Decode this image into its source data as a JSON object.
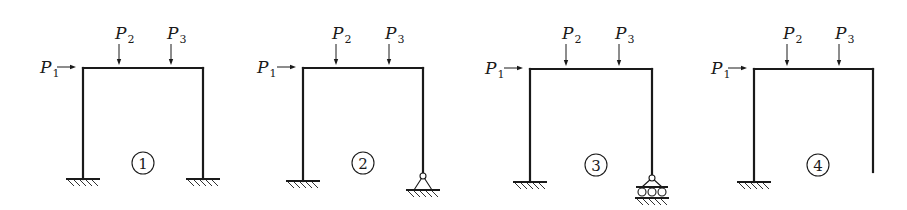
{
  "diagram": {
    "type": "structural-frame-comparison",
    "colors": {
      "ink": "#1a1a1a",
      "background": "#ffffff"
    },
    "loads": [
      {
        "id": "P1",
        "symbol": "P",
        "subscript": "1",
        "direction": "right",
        "position": "left-top-corner"
      },
      {
        "id": "P2",
        "symbol": "P",
        "subscript": "2",
        "direction": "down",
        "position": "beam-left-third"
      },
      {
        "id": "P3",
        "symbol": "P",
        "subscript": "3",
        "direction": "down",
        "position": "beam-right-third"
      }
    ],
    "frames": [
      {
        "label": "①",
        "left_support": "fixed",
        "right_support": "fixed",
        "geometry": {
          "left_x": 83,
          "right_x": 203,
          "beam_y": 68,
          "p1_label_x": 40,
          "p2_x": 119,
          "p3_x": 171,
          "left_base_y": 179,
          "right_base_y": 179,
          "num_x": 143,
          "num_y": 163
        }
      },
      {
        "label": "②",
        "left_support": "fixed",
        "right_support": "pinned",
        "geometry": {
          "left_x": 303,
          "right_x": 423,
          "beam_y": 68,
          "p1_label_x": 257,
          "p2_x": 336,
          "p3_x": 389,
          "left_base_y": 181,
          "right_base_y": 176,
          "num_x": 363,
          "num_y": 163
        }
      },
      {
        "label": "③",
        "left_support": "fixed",
        "right_support": "roller",
        "geometry": {
          "left_x": 530,
          "right_x": 652,
          "beam_y": 69,
          "p1_label_x": 485,
          "p2_x": 566,
          "p3_x": 619,
          "left_base_y": 182,
          "right_base_y": 178,
          "num_x": 596,
          "num_y": 165
        }
      },
      {
        "label": "④",
        "left_support": "fixed",
        "right_support": "free",
        "geometry": {
          "left_x": 754,
          "right_x": 873,
          "beam_y": 69,
          "p1_label_x": 711,
          "p2_x": 787,
          "p3_x": 839,
          "left_base_y": 182,
          "right_base_y": 172,
          "num_x": 818,
          "num_y": 165
        }
      }
    ]
  }
}
